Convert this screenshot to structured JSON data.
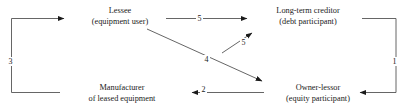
{
  "diagram": {
    "type": "flow-diagram",
    "stroke_color": "#444444",
    "text_color": "#1a1a1a",
    "background": "#ffffff",
    "nodes": [
      {
        "id": "lessee",
        "line1": "Lessee",
        "line2": "(equipment user)"
      },
      {
        "id": "creditor",
        "line1": "Long-term creditor",
        "line2": "(debt participant)"
      },
      {
        "id": "manufacturer",
        "line1": "Manufacturer",
        "line2": "of leased equipment"
      },
      {
        "id": "ownerlessor",
        "line1": "Owner-lessor",
        "line2": "(equity participant)"
      }
    ],
    "edges": [
      {
        "id": "edge-5-top",
        "label": "5",
        "from": "lessee",
        "to": "creditor"
      },
      {
        "id": "edge-5-diagonal",
        "label": "5",
        "from": "ownerlessor",
        "to": "creditor"
      },
      {
        "id": "edge-4",
        "label": "4",
        "from": "lessee",
        "to": "ownerlessor"
      },
      {
        "id": "edge-2",
        "label": "2",
        "from": "ownerlessor",
        "to": "manufacturer"
      },
      {
        "id": "edge-3",
        "label": "3",
        "from": "manufacturer",
        "to": "lessee"
      },
      {
        "id": "edge-1",
        "label": "1",
        "from": "creditor",
        "to": "ownerlessor"
      }
    ]
  }
}
